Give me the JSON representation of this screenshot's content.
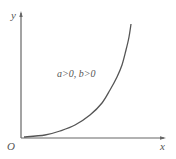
{
  "diagram": {
    "type": "function-graph",
    "axes": {
      "x_label": "x",
      "y_label": "y",
      "origin_label": "O"
    },
    "annotation": "a>0, b>0",
    "curve": {
      "description": "increasing exponential-like curve starting near origin, rising steeply to the right",
      "points": [
        [
          24,
          137
        ],
        [
          45,
          135
        ],
        [
          60,
          131
        ],
        [
          75,
          125
        ],
        [
          90,
          115
        ],
        [
          102,
          103
        ],
        [
          110,
          90
        ],
        [
          117,
          77
        ],
        [
          122,
          65
        ],
        [
          126,
          50
        ],
        [
          129,
          37
        ],
        [
          131,
          24
        ]
      ]
    },
    "colors": {
      "axis": "#666666",
      "curve": "#555555",
      "text": "#555555",
      "background": "#ffffff"
    }
  }
}
